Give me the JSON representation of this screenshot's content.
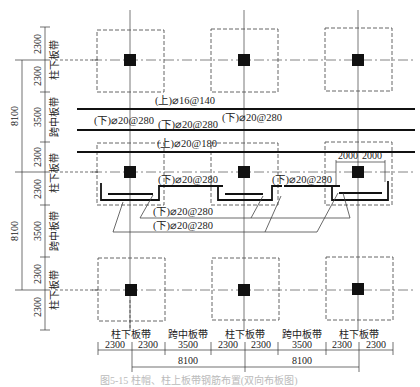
{
  "diagram": {
    "type": "slab reinforcement layout (flat slab with column strips and middle strips)",
    "columns": {
      "x": [
        130,
        244,
        358
      ],
      "y": [
        60,
        172,
        290
      ]
    },
    "strip_labels": {
      "column_strip": "柱下板带",
      "middle_strip": "跨中板带"
    },
    "left_dimensions": {
      "segments": [
        "2300",
        "2300",
        "3500",
        "2300",
        "2300",
        "3500",
        "2300",
        "2300"
      ],
      "spans": [
        "8100",
        "8100"
      ],
      "strip_labels": [
        "柱下板带",
        "跨中板带",
        "柱下板带",
        "跨中板带",
        "柱下板带"
      ]
    },
    "bottom_dimensions": {
      "segments": [
        "2300",
        "2300",
        "3500",
        "2300",
        "2300",
        "3500",
        "2300",
        "2300"
      ],
      "spans": [
        "8100",
        "8100"
      ],
      "strip_labels": [
        "柱下板带",
        "跨中板带",
        "柱下板带",
        "跨中板带",
        "柱下板带"
      ]
    },
    "rebar_labels": {
      "top_middle_strip": "(上)⌀16@140",
      "bottom_middle_left": "(下)⌀20@280",
      "bottom_middle_center": "(下)⌀20@280",
      "bottom_middle_right": "(下)⌀20@280",
      "top_column_strip": "(上)⌀20@180",
      "bottom_column_a": "(下)⌀20@280",
      "bottom_column_b": "(下)⌀20@280",
      "bottom_column_c": "(下)⌀20@280",
      "leader_1": "(下)⌀20@280",
      "leader_2": "(下)⌀20@280"
    },
    "column_cap_dimensions": [
      "2000",
      "2000"
    ],
    "caption": "图5-15 柱帽、柱上板带钢筋布置(双向布板图)"
  }
}
